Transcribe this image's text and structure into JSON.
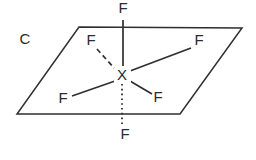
{
  "figure": {
    "panel_label": "C",
    "central_atom": "X",
    "ligand_label": "F",
    "stroke_color": "#2f2f2f",
    "text_color": "#2b2b2b",
    "background_color": "#ffffff",
    "plane": {
      "points": "79,27 242,28 180,114 17,114",
      "vertices": [
        {
          "name": "top-left",
          "x": 79,
          "y": 27
        },
        {
          "name": "top-right",
          "x": 242,
          "y": 28
        },
        {
          "name": "bottom-right",
          "x": 180,
          "y": 114
        },
        {
          "name": "bottom-left",
          "x": 17,
          "y": 114
        }
      ]
    },
    "center": {
      "x": 122,
      "y": 76
    },
    "panel_label_pos": {
      "x": 25,
      "y": 40
    },
    "atoms": [
      {
        "name": "fluorine-axial-top",
        "label": "F",
        "x": 123,
        "y": 9
      },
      {
        "name": "fluorine-equatorial-upper-left",
        "label": "F",
        "x": 91,
        "y": 41
      },
      {
        "name": "fluorine-equatorial-upper-right",
        "label": "F",
        "x": 199,
        "y": 41
      },
      {
        "name": "fluorine-equatorial-lower-left",
        "label": "F",
        "x": 63,
        "y": 99
      },
      {
        "name": "fluorine-equatorial-lower-right",
        "label": "F",
        "x": 158,
        "y": 98
      },
      {
        "name": "fluorine-axial-bottom",
        "label": "F",
        "x": 125,
        "y": 135
      },
      {
        "name": "central-atom-x",
        "label": "X",
        "x": 122,
        "y": 76
      }
    ],
    "bonds": [
      {
        "name": "bond-axial-top",
        "style": "solid",
        "x1": 123,
        "y1": 20,
        "x2": 123,
        "y2": 66
      },
      {
        "name": "bond-equatorial-upper-left",
        "style": "dashed",
        "x1": 97,
        "y1": 49,
        "x2": 115,
        "y2": 69
      },
      {
        "name": "bond-equatorial-upper-right",
        "style": "solid",
        "x1": 191,
        "y1": 48,
        "x2": 130,
        "y2": 71
      },
      {
        "name": "bond-equatorial-lower-left",
        "style": "solid",
        "x1": 72,
        "y1": 96,
        "x2": 115,
        "y2": 81
      },
      {
        "name": "bond-equatorial-lower-right",
        "style": "solid",
        "x1": 152,
        "y1": 94,
        "x2": 130,
        "y2": 81
      },
      {
        "name": "bond-axial-bottom",
        "style": "dotted",
        "x1": 122,
        "y1": 84,
        "x2": 122,
        "y2": 126
      }
    ]
  }
}
